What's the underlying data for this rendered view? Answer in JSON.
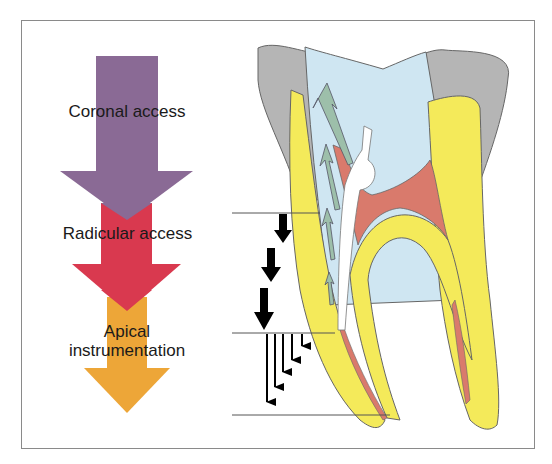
{
  "diagram": {
    "stages": [
      {
        "label": "Coronal access",
        "color": "#8a6a95"
      },
      {
        "label": "Radicular access",
        "color": "#d9394f"
      },
      {
        "label": "Apical instrumentation",
        "label_lines": [
          "Apical",
          "instrumentation"
        ],
        "color": "#eda638"
      }
    ],
    "colors": {
      "enamel": "#b5b5b5",
      "dentin": "#f4ea5a",
      "pulp_chamber": "#cfe6f2",
      "pulp_tissue": "#d97a6c",
      "instrument_arrows": "#9dbfaa",
      "frame": "#8a8a8a"
    },
    "reference_lines": 3,
    "progress_arrows": {
      "radicular_steps": 3,
      "apical_steps": 5
    }
  }
}
